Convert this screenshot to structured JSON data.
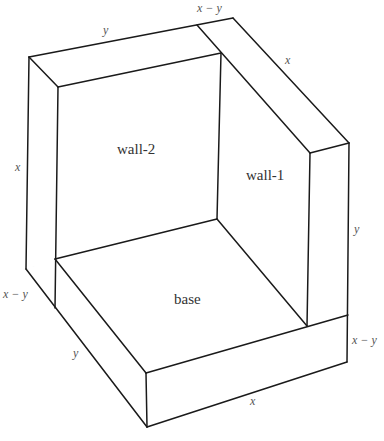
{
  "diagram": {
    "title": "",
    "regions": {
      "wall2": "wall-2",
      "wall1": "wall-1",
      "base": "base"
    },
    "dimensions": {
      "top_left_edge": "y",
      "top_right_thickness": "x − y",
      "top_right_edge": "x",
      "left_height": "x",
      "right_height": "y",
      "left_thickness": "x − y",
      "base_depth": "y",
      "base_right_thickness": "x − y",
      "base_width": "x"
    },
    "colors": {
      "edge": "#1a1a1a",
      "hidden_edge": "#d6d6d6",
      "label": "#333333",
      "dim_label": "#555555",
      "background": "#ffffff"
    }
  }
}
